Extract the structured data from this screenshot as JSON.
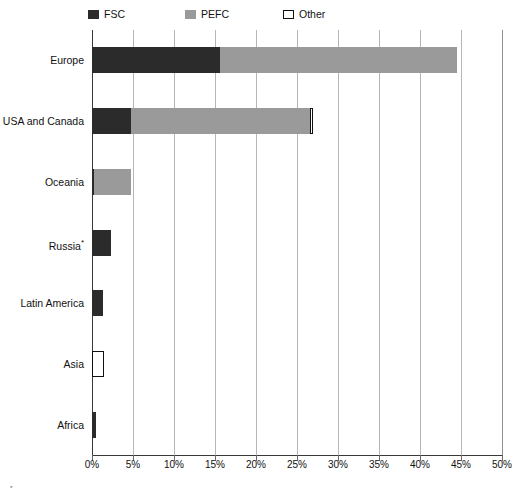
{
  "legend": {
    "position": "top",
    "items": [
      {
        "label": "FSC",
        "color": "#2b2b2b",
        "style": "filled",
        "icon": "square-swatch-icon"
      },
      {
        "label": "PEFC",
        "color": "#9a9a9a",
        "style": "filled",
        "icon": "square-swatch-icon"
      },
      {
        "label": "Other",
        "color": "#ffffff",
        "style": "outline",
        "icon": "square-outline-swatch-icon"
      }
    ]
  },
  "axis": {
    "x_ticks": [
      "0%",
      "5%",
      "10%",
      "15%",
      "20%",
      "25%",
      "30%",
      "35%",
      "40%",
      "45%",
      "50%"
    ],
    "x_min": 0,
    "x_max": 50
  },
  "footnote": {
    "marker": "*",
    "text": ""
  },
  "chart_data": {
    "type": "bar",
    "orientation": "horizontal",
    "stacked": true,
    "title": "",
    "subtitle": "",
    "xlabel": "",
    "ylabel": "",
    "xlim": [
      0,
      50
    ],
    "x_tick_step": 5,
    "x_unit": "%",
    "grid": true,
    "legend_position": "top",
    "categories": [
      "Europe",
      "USA and Canada",
      "Oceania",
      "Russia*",
      "Latin America",
      "Asia",
      "Africa"
    ],
    "series": [
      {
        "name": "FSC",
        "color": "#2b2b2b",
        "values": [
          15.6,
          4.8,
          0.3,
          2.3,
          1.4,
          0.0,
          0.5
        ]
      },
      {
        "name": "PEFC",
        "color": "#9a9a9a",
        "values": [
          28.9,
          21.8,
          4.5,
          0.0,
          0.0,
          0.0,
          0.0
        ]
      },
      {
        "name": "Other",
        "color": "#ffffff",
        "values": [
          0.0,
          0.4,
          0.0,
          0.0,
          0.0,
          1.5,
          0.0
        ]
      }
    ],
    "totals": [
      44.5,
      27.0,
      4.8,
      2.3,
      1.4,
      1.5,
      0.5
    ]
  }
}
